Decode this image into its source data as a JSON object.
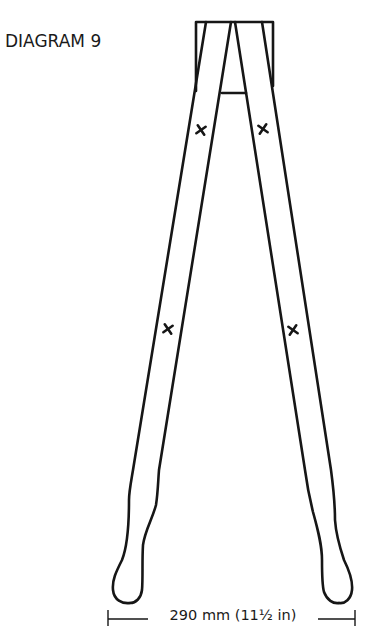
{
  "figure": {
    "title": "DIAGRAM 9",
    "dimension_label": "290 mm (11½ in)",
    "markers": [
      {
        "name": "upper-left-cross",
        "glyph": "✕"
      },
      {
        "name": "upper-right-cross",
        "glyph": "✕"
      },
      {
        "name": "lower-left-cross",
        "glyph": "✕"
      },
      {
        "name": "lower-right-cross",
        "glyph": "✕"
      }
    ],
    "line_color": "#161616"
  }
}
